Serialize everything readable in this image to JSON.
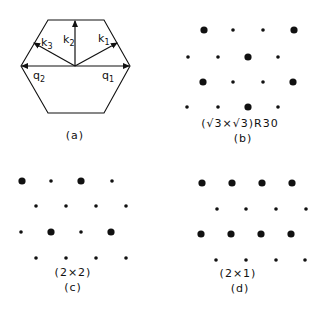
{
  "figure": {
    "panels": [
      {
        "id": "a",
        "caption": "(a)",
        "type": "brillouin-zone-hexagon",
        "vectors": [
          {
            "name": "k",
            "sub": "1"
          },
          {
            "name": "k",
            "sub": "2"
          },
          {
            "name": "k",
            "sub": "3"
          },
          {
            "name": "q",
            "sub": "1"
          },
          {
            "name": "q",
            "sub": "2"
          }
        ]
      },
      {
        "id": "b",
        "caption": "(b)",
        "structure": "(√3×√3)R30",
        "rows": [
          [
            "big",
            "small",
            "small",
            "big"
          ],
          [
            "small",
            "small",
            "big",
            "small"
          ],
          [
            "big",
            "small",
            "small",
            "big"
          ],
          [
            "small",
            "small",
            "big",
            "small"
          ]
        ]
      },
      {
        "id": "c",
        "caption": "(c)",
        "structure": "(2×2)",
        "rows": [
          [
            "big",
            "small",
            "big",
            "small"
          ],
          [
            "small",
            "small",
            "small",
            "small"
          ],
          [
            "small",
            "big",
            "small",
            "big"
          ],
          [
            "small",
            "small",
            "small",
            "small"
          ]
        ]
      },
      {
        "id": "d",
        "caption": "(d)",
        "structure": "(2×1)",
        "rows": [
          [
            "big",
            "big",
            "big",
            "big"
          ],
          [
            "small",
            "small",
            "small",
            "small"
          ],
          [
            "big",
            "big",
            "big",
            "big"
          ],
          [
            "small",
            "small",
            "small",
            "small"
          ]
        ]
      }
    ]
  }
}
